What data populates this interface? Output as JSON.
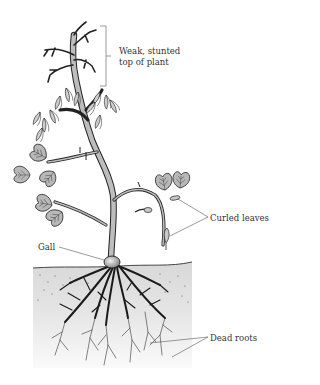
{
  "figure": {
    "type": "plant-disease-illustration",
    "colors": {
      "outline": "#222222",
      "leaf_fill": "#b8b8b8",
      "stem_fill": "#bdbdbd",
      "soil_top": "#dcdcdc",
      "soil_bottom": "#f6f6f6",
      "leader_line": "#666666"
    }
  },
  "labels": {
    "top": [
      "Weak, stunted",
      "top of plant"
    ],
    "curled_leaves": "Curled leaves",
    "gall": "Gall",
    "dead_roots": "Dead roots"
  }
}
